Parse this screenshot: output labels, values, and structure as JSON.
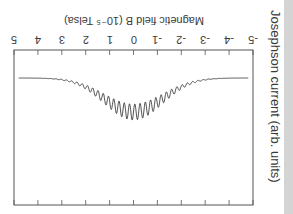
{
  "chart_data": {
    "type": "line",
    "orientation_note": "figure rendered rotated 180 degrees",
    "title": "",
    "xlabel": "Magnetic field B (10^-5 Telsa)",
    "ylabel": "Josephson current (arb. units)",
    "xlim": [
      -5,
      5
    ],
    "x_ticks": [
      -5,
      -4,
      -3,
      -2,
      -1,
      0,
      1,
      2,
      3,
      4,
      5
    ],
    "series": [
      {
        "name": "Josephson current",
        "description": "flat baseline at |B|>3 with a smooth dip centered at B=0 modulated by rapid oscillations (~0.2e-5 T period)",
        "baseline": 1.0,
        "dip_center": 0,
        "dip_depth": 0.45,
        "dip_halfwidth": 2.2,
        "oscillation_period": 0.22,
        "oscillation_amplitude_max": 0.2
      }
    ],
    "grid": false,
    "legend": null
  },
  "labels": {
    "xlabel": "Magnetic field B (10⁻⁵ Telsa)",
    "ylabel": "Josephson current (arb. units)",
    "ticks": [
      "-5",
      "-4",
      "-3",
      "-2",
      "-1",
      "0",
      "1",
      "2",
      "3",
      "4",
      "5"
    ]
  }
}
